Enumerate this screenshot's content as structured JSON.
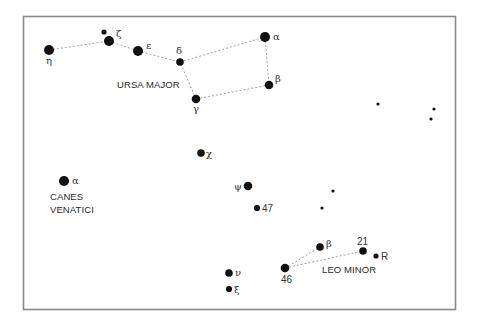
{
  "map": {
    "type": "star-chart",
    "constellations": [
      {
        "id": "ursa-major",
        "name_lines": [
          "URSA MAJOR"
        ],
        "stars": [
          {
            "id": "eta",
            "label": "η",
            "magnitude_class": "large"
          },
          {
            "id": "zeta-companion",
            "label": "",
            "magnitude_class": "small"
          },
          {
            "id": "zeta",
            "label": "ζ",
            "magnitude_class": "large"
          },
          {
            "id": "epsilon",
            "label": "ε",
            "magnitude_class": "large"
          },
          {
            "id": "delta",
            "label": "δ",
            "magnitude_class": "medium"
          },
          {
            "id": "alpha",
            "label": "α",
            "magnitude_class": "large"
          },
          {
            "id": "beta",
            "label": "β",
            "magnitude_class": "medium-large"
          },
          {
            "id": "gamma",
            "label": "γ",
            "magnitude_class": "medium-large"
          }
        ],
        "lines": [
          [
            "eta",
            "zeta"
          ],
          [
            "zeta",
            "epsilon"
          ],
          [
            "epsilon",
            "delta"
          ],
          [
            "delta",
            "alpha"
          ],
          [
            "alpha",
            "beta"
          ],
          [
            "beta",
            "gamma"
          ],
          [
            "gamma",
            "delta"
          ]
        ]
      },
      {
        "id": "canes-venatici",
        "name_lines": [
          "CANES",
          "VENATICI"
        ],
        "stars": [
          {
            "id": "alpha",
            "label": "α",
            "magnitude_class": "large"
          }
        ],
        "lines": []
      },
      {
        "id": "leo-minor",
        "name_lines": [
          "LEO MINOR"
        ],
        "stars": [
          {
            "id": "46",
            "label": "46",
            "magnitude_class": "medium-large"
          },
          {
            "id": "beta",
            "label": "β",
            "magnitude_class": "medium"
          },
          {
            "id": "21",
            "label": "21",
            "magnitude_class": "medium"
          },
          {
            "id": "R",
            "label": "R",
            "magnitude_class": "small"
          }
        ],
        "lines": [
          [
            "46",
            "beta"
          ],
          [
            "46",
            "21"
          ]
        ]
      }
    ],
    "field_stars": [
      {
        "id": "chi",
        "label": "χ",
        "magnitude_class": "medium"
      },
      {
        "id": "psi",
        "label": "ψ",
        "magnitude_class": "medium-large"
      },
      {
        "id": "47",
        "label": "47",
        "magnitude_class": "medium-small"
      },
      {
        "id": "nu",
        "label": "ν",
        "magnitude_class": "medium"
      },
      {
        "id": "xi",
        "label": "ξ",
        "magnitude_class": "medium-small"
      },
      {
        "id": "f1",
        "label": "",
        "magnitude_class": "tiny"
      },
      {
        "id": "f2",
        "label": "",
        "magnitude_class": "tiny"
      },
      {
        "id": "f3",
        "label": "",
        "magnitude_class": "tiny"
      },
      {
        "id": "f4",
        "label": "",
        "magnitude_class": "tiny"
      },
      {
        "id": "f5",
        "label": "",
        "magnitude_class": "tiny"
      }
    ]
  }
}
